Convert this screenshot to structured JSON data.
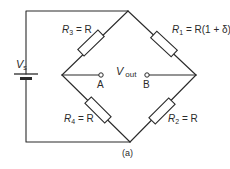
{
  "diagram": {
    "type": "wheatstone-bridge-circuit",
    "caption": "(a)",
    "source": {
      "label_main": "V",
      "label_sub": "s"
    },
    "output": {
      "label_main": "V",
      "label_sub": "out",
      "terminal_a": "A",
      "terminal_b": "B"
    },
    "resistors": [
      {
        "id": "R1",
        "letter": "R",
        "sub": "1",
        "value": " = R(1 + δ)",
        "arm": "top-right"
      },
      {
        "id": "R2",
        "letter": "R",
        "sub": "2",
        "value": " = R",
        "arm": "bottom-right"
      },
      {
        "id": "R3",
        "letter": "R",
        "sub": "3",
        "value": " = R",
        "arm": "top-left"
      },
      {
        "id": "R4",
        "letter": "R",
        "sub": "4",
        "value": " = R",
        "arm": "bottom-left"
      }
    ],
    "colors": {
      "line": "#2a2a2a",
      "background": "#ffffff"
    }
  }
}
